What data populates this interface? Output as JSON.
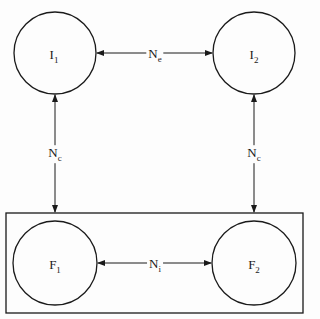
{
  "diagram": {
    "nodes": [
      {
        "id": "I1",
        "main": "I",
        "sub": "1",
        "cx": 55,
        "cy": 53,
        "r": 41
      },
      {
        "id": "I2",
        "main": "I",
        "sub": "2",
        "cx": 254,
        "cy": 53,
        "r": 41
      },
      {
        "id": "F1",
        "main": "F",
        "sub": "1",
        "cx": 55,
        "cy": 263,
        "r": 42
      },
      {
        "id": "F2",
        "main": "F",
        "sub": "2",
        "cx": 254,
        "cy": 263,
        "r": 42
      }
    ],
    "edges": [
      {
        "from": "I1",
        "to": "I2",
        "label_main": "N",
        "label_sub": "e",
        "type": "bidirectional"
      },
      {
        "from": "I1",
        "to": "F1",
        "label_main": "N",
        "label_sub": "c",
        "type": "bidirectional"
      },
      {
        "from": "I2",
        "to": "F2",
        "label_main": "N",
        "label_sub": "c",
        "type": "bidirectional"
      },
      {
        "from": "F1",
        "to": "F2",
        "label_main": "N",
        "label_sub": "i",
        "type": "bidirectional"
      }
    ],
    "group_box": {
      "contains": [
        "F1",
        "F2"
      ]
    },
    "stroke_color": "#1a1a1a"
  }
}
